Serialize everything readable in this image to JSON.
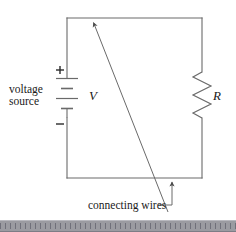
{
  "figure": {
    "type": "electrical-circuit-schematic",
    "canvas": {
      "width": 236,
      "height": 232
    },
    "background_color": "#ffffff",
    "line_color": "#5a5a5a",
    "text_color": "#1a1a1a"
  },
  "labels": {
    "voltage_source_line1": "voltage",
    "voltage_source_line2": "source",
    "voltage_symbol": "V",
    "resistor_symbol": "R",
    "polarity_positive": "+",
    "polarity_negative": "−",
    "connecting_wires": "connecting wires"
  },
  "components": {
    "battery": {
      "name": "voltage source",
      "symbol": "battery-multicell",
      "label": "V",
      "plate_count": 4,
      "positive_terminal": "top",
      "negative_terminal": "bottom",
      "position": {
        "x": 67,
        "y_top": 78,
        "y_bottom": 118
      }
    },
    "resistor": {
      "name": "resistor",
      "symbol": "resistor-zigzag",
      "label": "R",
      "zigzag_peaks": 3,
      "position": {
        "x": 202,
        "y_top": 72,
        "y_bottom": 118
      }
    },
    "wires": {
      "name": "connecting wires",
      "shape": "rectangle-loop",
      "left": 67,
      "right": 202,
      "top": 18,
      "bottom": 178
    }
  },
  "annotations": [
    {
      "name": "leader-to-top-wire",
      "text": "connecting wires",
      "arrow_tip": {
        "x": 92,
        "y": 21
      },
      "arrow_tail": {
        "x": 168,
        "y": 212
      },
      "style": "diagonal-line-with-arrowhead"
    },
    {
      "name": "leader-to-bottom-wire",
      "text": "connecting wires",
      "arrow_tip": {
        "x": 172,
        "y": 180
      },
      "arrow_tail": {
        "x": 172,
        "y": 205
      },
      "style": "elbow-line-with-arrowhead"
    }
  ],
  "ruler": {
    "name": "bottom-ruler-strip",
    "color": "#9b9ba1",
    "tick_color": "#70707a",
    "tick_spacing_px": 5
  }
}
